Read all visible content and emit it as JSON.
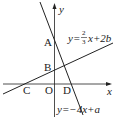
{
  "diagram": {
    "axes": {
      "x_label": "x",
      "y_label": "y",
      "origin_label": "O"
    },
    "points": {
      "A": "A",
      "B": "B",
      "C": "C",
      "D": "D"
    },
    "line1": {
      "prefix": "y=",
      "num": "2",
      "den": "3",
      "suffix": "x+2b"
    },
    "line2": {
      "equation": "y=−4x+a"
    },
    "colors": {
      "stroke": "#222222",
      "background": "#ffffff"
    }
  }
}
